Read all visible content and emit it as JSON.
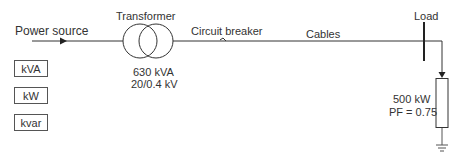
{
  "diagram": {
    "source_label": "Power source",
    "transformer": {
      "label": "Transformer",
      "rating": "630 kVA",
      "voltage": "20/0.4 kV"
    },
    "breaker_label": "Circuit breaker",
    "cables_label": "Cables",
    "load": {
      "label": "Load",
      "power": "500 kW",
      "power_factor": "PF = 0.75"
    },
    "units": [
      {
        "label": "kVA"
      },
      {
        "label": "kW"
      },
      {
        "label": "kvar"
      }
    ],
    "colors": {
      "line": "#333333",
      "text": "#333333",
      "background": "#ffffff"
    }
  }
}
